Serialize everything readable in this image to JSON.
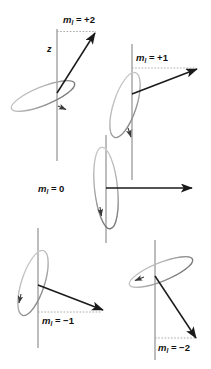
{
  "figure": {
    "axis_label": "z",
    "background_color": "#ffffff",
    "axis_color": "#8a8a8a",
    "vector_color": "#1a1a1a",
    "cone_color": "#b5b5b5",
    "dash_color": "#9a9a9a",
    "text_color": "#111111"
  },
  "panels": [
    {
      "id": "m-plus-2",
      "symbol": "m",
      "subscript": "l",
      "equals": " = ",
      "value": "+2",
      "label": "m_l = +2",
      "axis_label": "z",
      "has_axis_label": true,
      "has_dashed_guide": true,
      "vector_angle_deg": 45,
      "cone_tilt": "shallow"
    },
    {
      "id": "m-plus-1",
      "symbol": "m",
      "subscript": "l",
      "equals": " = ",
      "value": "+1",
      "label": "m_l = +1",
      "has_axis_label": false,
      "has_dashed_guide": true,
      "vector_angle_deg": 20,
      "cone_tilt": "medium"
    },
    {
      "id": "m-zero",
      "symbol": "m",
      "subscript": "l",
      "equals": " = ",
      "value": "0",
      "label": "m_l = 0",
      "has_axis_label": false,
      "has_dashed_guide": false,
      "vector_angle_deg": 0,
      "cone_tilt": "vertical"
    },
    {
      "id": "m-minus-1",
      "symbol": "m",
      "subscript": "l",
      "equals": " = ",
      "value": "−1",
      "label": "m_l = -1",
      "has_axis_label": false,
      "has_dashed_guide": true,
      "vector_angle_deg": -20,
      "cone_tilt": "medium"
    },
    {
      "id": "m-minus-2",
      "symbol": "m",
      "subscript": "l",
      "equals": " = ",
      "value": "−2",
      "label": "m_l = -2",
      "has_axis_label": false,
      "has_dashed_guide": true,
      "vector_angle_deg": -45,
      "cone_tilt": "shallow"
    }
  ]
}
